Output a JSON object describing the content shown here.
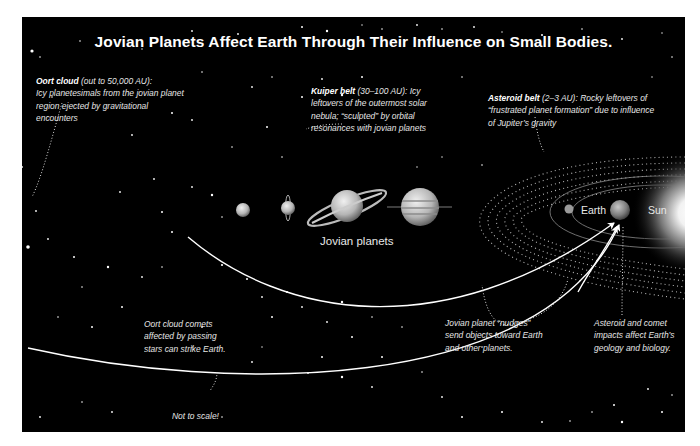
{
  "title": "Jovian Planets Affect Earth Through Their Influence on Small Bodies.",
  "annotations": {
    "oort": {
      "heading": "Oort cloud",
      "range": "(out to 50,000 AU):",
      "body": "Icy planetesimals from the jovian planet region ejected by gravitational encounters"
    },
    "kuiper": {
      "heading": "Kuiper belt",
      "range": "(30–100 AU):",
      "body": "Icy leftovers of the outermost solar nebula; “sculpted” by orbital resonances with jovian planets"
    },
    "asteroid": {
      "heading": "Asteroid belt",
      "range": "(2–3 AU):",
      "body": "Rocky leftovers of “frustrated planet formation” due to influence of Jupiter’s gravity"
    },
    "oort_comets": "Oort cloud comets affected by passing stars can strike Earth.",
    "nudges": "Jovian planet “nudges” send objects toward Earth and other planets.",
    "impacts": "Asteroid and comet impacts affect Earth’s geology and biology."
  },
  "labels": {
    "jovian_planets": "Jovian planets",
    "earth": "Earth",
    "sun": "Sun",
    "scale_note": "Not to scale!"
  },
  "bodies": [
    "Neptune",
    "Uranus",
    "Saturn",
    "Jupiter",
    "Mars",
    "Earth",
    "Sun"
  ],
  "colors": {
    "background": "#000000",
    "frame": "#ffffff",
    "text": "#e6e6e6",
    "arrow": "#ffffff"
  }
}
